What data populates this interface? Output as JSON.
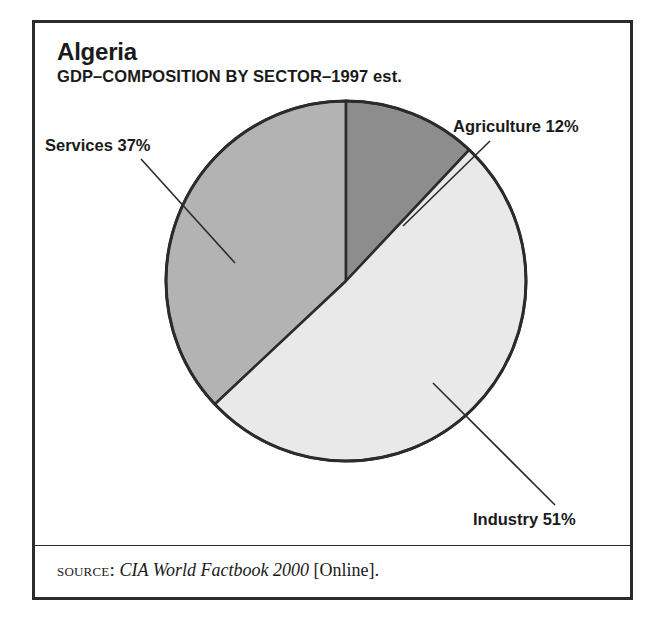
{
  "figure": {
    "title": "Algeria",
    "subtitle": "GDP–COMPOSITION BY SECTOR–1997 est.",
    "source": {
      "label": "source:",
      "publication": "CIA World Factbook 2000",
      "suffix": "[Online]."
    },
    "frame_color": "#2b2b2b"
  },
  "labels": {
    "services": "Services 37%",
    "agriculture": "Agriculture 12%",
    "industry": "Industry 51%"
  },
  "chart_data": {
    "type": "pie",
    "title": "Algeria",
    "subtitle": "GDP–COMPOSITION BY SECTOR–1997 est.",
    "xlabel": "",
    "ylabel": "",
    "units": "percent",
    "start_angle_deg": 0,
    "direction": "clockwise",
    "legend": "none (direct labels with leader lines)",
    "grid": false,
    "categories": [
      "Agriculture",
      "Industry",
      "Services"
    ],
    "values": [
      12,
      51,
      37
    ],
    "slice_colors": [
      "#8d8d8d",
      "#e9e9e9",
      "#b3b3b3"
    ],
    "slice_outline_color": "#2b2b2b",
    "annotations": [
      {
        "text": "Agriculture 12%",
        "category": "Agriculture",
        "value": 12
      },
      {
        "text": "Industry 51%",
        "category": "Industry",
        "value": 51
      },
      {
        "text": "Services 37%",
        "category": "Services",
        "value": 37
      }
    ]
  }
}
